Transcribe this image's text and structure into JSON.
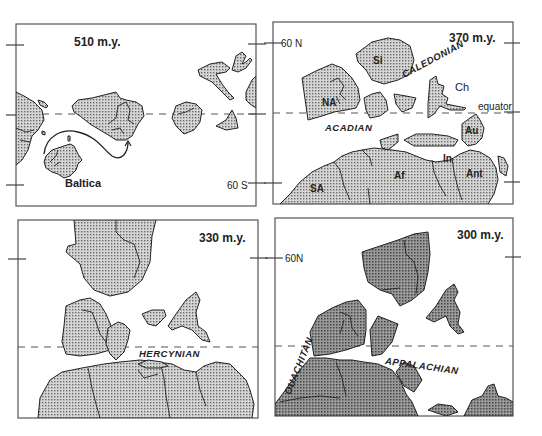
{
  "figure": {
    "panels": [
      {
        "id": "p510",
        "age_label": "510 m.y.",
        "labels": {
          "baltica": "Baltica",
          "lat_south": "60 S"
        }
      },
      {
        "id": "p370",
        "age_label": "370 m.y.",
        "labels": {
          "lat_north": "60 N",
          "equator": "equator",
          "orogenies": [
            "CALEDONIAN",
            "ACADIAN"
          ],
          "continents": {
            "NA": "NA",
            "Si": "Si",
            "Ch": "Ch",
            "Au": "Au",
            "In": "In",
            "Af": "Af",
            "Ant": "Ant",
            "SA": "SA"
          }
        }
      },
      {
        "id": "p330",
        "age_label": "330 m.y.",
        "labels": {
          "orogenies": [
            "HERCYNIAN"
          ]
        }
      },
      {
        "id": "p300",
        "age_label": "300 m.y.",
        "labels": {
          "lat_north": "60N",
          "orogenies": [
            "OUACHITAN",
            "APPALACHIAN"
          ]
        }
      }
    ]
  },
  "colors": {
    "frame": "#555555",
    "land_fill": "#b8b8b8",
    "land_dark": "#8a8a8a",
    "outline": "#222222",
    "background": "#ffffff"
  }
}
